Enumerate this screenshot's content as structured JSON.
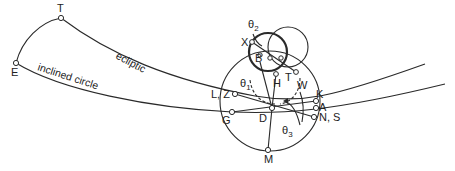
{
  "diagram": {
    "type": "astronomical-geometry",
    "colors": {
      "line": "#2a2a2a",
      "background": "#ffffff",
      "point_fill": "#ffffff"
    },
    "curves": {
      "ecliptic": {
        "label": "ecliptic"
      },
      "inclined": {
        "label": "inclined circle"
      }
    },
    "points": {
      "T": "T",
      "E": "E",
      "X": "X",
      "B": "B",
      "TC": "T",
      "H": "H",
      "W": "W",
      "K": "K",
      "A": "A",
      "NS": "N, S",
      "LZ": "L, Z",
      "G": "G",
      "D": "D",
      "M": "M"
    },
    "angles": {
      "theta1": {
        "sym": "θ",
        "sub": "1"
      },
      "theta2": {
        "sym": "θ",
        "sub": "2"
      },
      "theta3": {
        "sym": "θ",
        "sub": "3"
      }
    }
  }
}
